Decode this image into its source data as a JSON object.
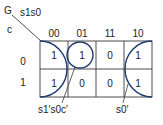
{
  "kmap": {
    "output_var": "G",
    "col_vars": "s1s0",
    "row_var": "c",
    "col_headers": [
      "00",
      "01",
      "11",
      "10"
    ],
    "row_headers": [
      "0",
      "1"
    ],
    "cells": [
      [
        "1",
        "1",
        "0",
        "1"
      ],
      [
        "1",
        "0",
        "0",
        "1"
      ]
    ],
    "groups": [
      {
        "label": "s1's0c'",
        "cells": "row 0, col 01 (paired with col 00 via circle)"
      },
      {
        "label": "s0'",
        "cells": "cols 00 and 10, both rows (wrap-around)"
      }
    ],
    "group_labels": [
      "s1′s0c′",
      "s0′"
    ],
    "colors": {
      "grid": "#3a3a3a",
      "circle": "#1f3a6e",
      "text": "#222222"
    }
  }
}
